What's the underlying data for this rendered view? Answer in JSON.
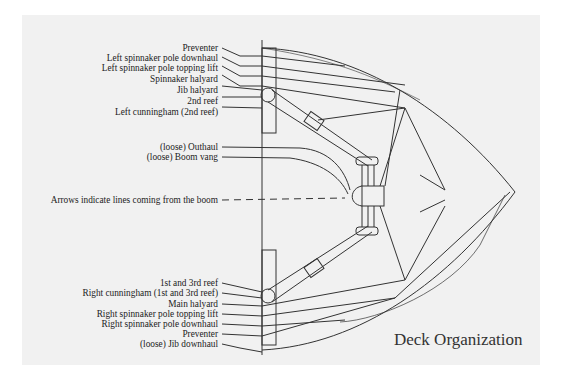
{
  "title": "Deck Organization",
  "labels_top": [
    "Preventer",
    "Left spinnaker pole downhaul",
    "Left spinnaker pole topping lift",
    "Spinnaker halyard",
    "Jib halyard",
    "2nd reef",
    "Left cunningham (2nd reef)"
  ],
  "labels_middle": [
    "(loose) Outhaul",
    "(loose) Boom vang"
  ],
  "annotation": "Arrows indicate lines coming from the boom",
  "labels_bottom": [
    "1st and 3rd reef",
    "Right cunningham (1st and 3rd reef)",
    "Main halyard",
    "Right spinnaker pole topping lift",
    "Right spinnaker pole downhaul",
    "Preventer",
    "(loose) Jib downhaul"
  ],
  "colors": {
    "line": "#333333",
    "panel": "#f1f1f1",
    "text": "#222222"
  }
}
